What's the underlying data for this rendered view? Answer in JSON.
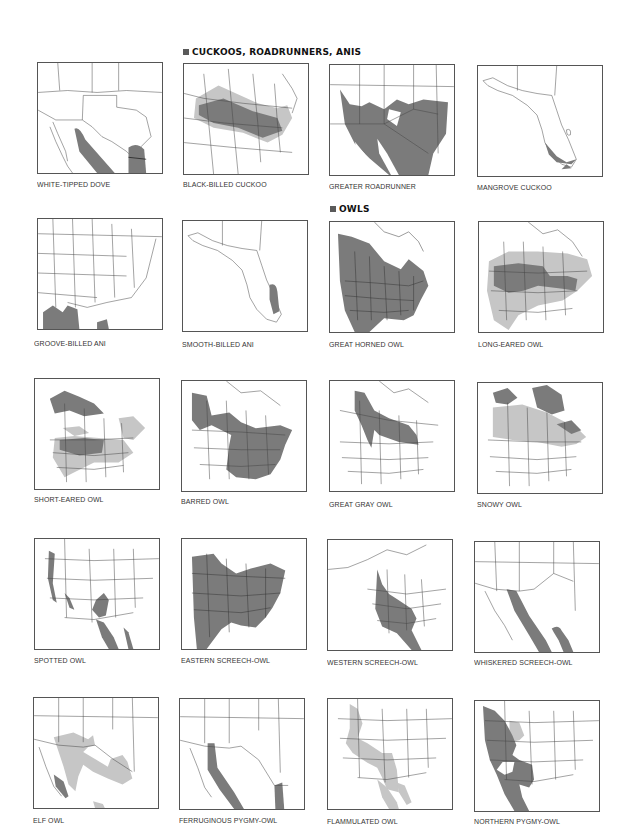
{
  "sections": {
    "cuckoos": {
      "title": "CUCKOOS, ROADRUNNERS, ANIS"
    },
    "owls": {
      "title": "OWLS"
    }
  },
  "colors": {
    "range_dark": "#7b7b7b",
    "range_light": "#c6c6c6",
    "border": "#444444",
    "header_square": "#5a5a5a"
  },
  "maps": [
    {
      "id": "white-tipped-dove",
      "label": "WHITE-TIPPED DOVE",
      "region": "texas-mexico"
    },
    {
      "id": "black-billed-cuckoo",
      "label": "BLACK-BILLED CUCKOO",
      "region": "north-america"
    },
    {
      "id": "greater-roadrunner",
      "label": "GREATER ROADRUNNER",
      "region": "southwest"
    },
    {
      "id": "mangrove-cuckoo",
      "label": "MANGROVE CUCKOO",
      "region": "florida"
    },
    {
      "id": "groove-billed-ani",
      "label": "GROOVE-BILLED ANI",
      "region": "eastern-us"
    },
    {
      "id": "smooth-billed-ani",
      "label": "SMOOTH-BILLED ANI",
      "region": "florida"
    },
    {
      "id": "great-horned-owl",
      "label": "GREAT HORNED OWL",
      "region": "north-america"
    },
    {
      "id": "long-eared-owl",
      "label": "LONG-EARED OWL",
      "region": "north-america"
    },
    {
      "id": "short-eared-owl",
      "label": "SHORT-EARED OWL",
      "region": "north-america"
    },
    {
      "id": "barred-owl",
      "label": "BARRED OWL",
      "region": "north-america"
    },
    {
      "id": "great-gray-owl",
      "label": "GREAT GRAY OWL",
      "region": "north-america"
    },
    {
      "id": "snowy-owl",
      "label": "SNOWY OWL",
      "region": "north-america"
    },
    {
      "id": "spotted-owl",
      "label": "SPOTTED OWL",
      "region": "western-us"
    },
    {
      "id": "eastern-screech-owl",
      "label": "EASTERN SCREECH-OWL",
      "region": "eastern-us"
    },
    {
      "id": "western-screech-owl",
      "label": "WESTERN SCREECH-OWL",
      "region": "north-america"
    },
    {
      "id": "whiskered-screech-owl",
      "label": "WHISKERED SCREECH-OWL",
      "region": "texas-mexico"
    },
    {
      "id": "elf-owl",
      "label": "ELF OWL",
      "region": "texas-mexico"
    },
    {
      "id": "ferruginous-pygmy-owl",
      "label": "FERRUGINOUS PYGMY-OWL",
      "region": "texas-mexico"
    },
    {
      "id": "flammulated-owl",
      "label": "FLAMMULATED OWL",
      "region": "western-us"
    },
    {
      "id": "northern-pygmy-owl",
      "label": "NORTHERN PYGMY-OWL",
      "region": "western-us"
    }
  ]
}
